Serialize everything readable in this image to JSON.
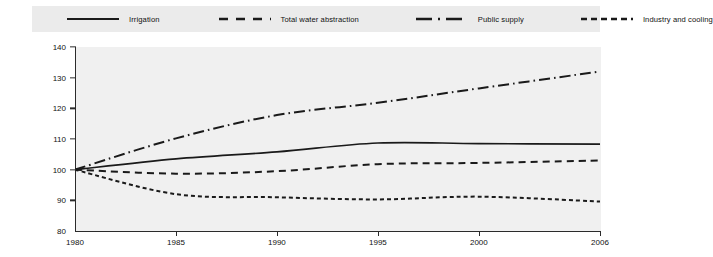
{
  "chart_data": {
    "type": "line",
    "title": "",
    "subtitle": "",
    "xlabel": "",
    "ylabel": "",
    "xlim": [
      1980,
      2006
    ],
    "ylim": [
      80,
      140
    ],
    "yticks": [
      80,
      90,
      100,
      110,
      120,
      130,
      140
    ],
    "xticks": [
      1980,
      1985,
      1990,
      1995,
      2000,
      2006
    ],
    "grid": false,
    "legend_position": "top",
    "index_base": "1980 = 100",
    "x": [
      1980,
      1985,
      1990,
      1995,
      2000,
      2006
    ],
    "series": [
      {
        "name": "Irrigation",
        "style": "solid",
        "color": "#1a1a1a",
        "values": [
          100,
          103.5,
          105.8,
          108.7,
          108.5,
          108.3
        ]
      },
      {
        "name": "Total water abstraction",
        "style": "dashed",
        "color": "#1a1a1a",
        "values": [
          100,
          98.7,
          99.5,
          101.8,
          102.2,
          103.0
        ]
      },
      {
        "name": "Public supply",
        "style": "dashdot",
        "color": "#1a1a1a",
        "values": [
          100,
          110.2,
          117.8,
          121.8,
          126.5,
          132.0
        ]
      },
      {
        "name": "Industry and cooling",
        "style": "finedash",
        "color": "#1a1a1a",
        "values": [
          100,
          92.0,
          91.0,
          90.3,
          91.2,
          89.6
        ]
      }
    ]
  },
  "legend": {
    "items": [
      {
        "label": "Irrigation",
        "swatch": "solid-line-swatch"
      },
      {
        "label": "Total water abstraction",
        "swatch": "dashed-line-swatch"
      },
      {
        "label": "Public supply",
        "swatch": "dashdot-line-swatch"
      },
      {
        "label": "Industry and cooling",
        "swatch": "finedash-line-swatch"
      }
    ]
  },
  "axes": {
    "y_labels": [
      "140",
      "130",
      "120",
      "110",
      "100",
      "90",
      "80"
    ],
    "x_labels": [
      "1980",
      "1985",
      "1990",
      "1995",
      "2000",
      "2006"
    ]
  },
  "colors": {
    "line": "#1a1a1a",
    "plot_background": "#f0f0f0",
    "legend_background": "#ebebeb",
    "axis": "#2b2b2b"
  }
}
